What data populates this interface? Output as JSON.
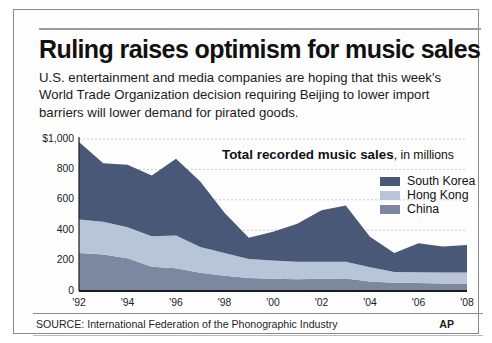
{
  "headline": "Ruling raises optimism for music sales",
  "deck": "U.S. entertainment and media companies are hoping that this week's World Trade Organization decision requiring Beijing to lower import barriers will lower demand for pirated goods.",
  "source": {
    "label": "SOURCE: International Federation of the Phonographic Industry",
    "credit": "AP"
  },
  "colors": {
    "south_korea": "#4a5878",
    "hong_kong": "#b8c4d8",
    "china": "#7c889f",
    "axis": "#1b1b1b",
    "grid": "#c9c9d2"
  },
  "chart_data": {
    "type": "area",
    "stacked": true,
    "title": "Total recorded music sales",
    "subtitle": ", in millions",
    "xlabel": "",
    "ylabel": "",
    "ylim": [
      0,
      1000
    ],
    "yticks": [
      0,
      200,
      400,
      600,
      800,
      1000
    ],
    "ytick_labels": [
      "0",
      "200",
      "400",
      "600",
      "800",
      "$1,000"
    ],
    "grid": true,
    "legend_position": "top-right",
    "x": [
      1992,
      1993,
      1994,
      1995,
      1996,
      1997,
      1998,
      1999,
      2000,
      2001,
      2002,
      2003,
      2004,
      2005,
      2006,
      2007,
      2008
    ],
    "xtick_values": [
      1992,
      1994,
      1996,
      1998,
      2000,
      2002,
      2004,
      2006,
      2008
    ],
    "xtick_labels": [
      "'92",
      "'94",
      "'96",
      "'98",
      "'00",
      "'02",
      "'04",
      "'06",
      "'08"
    ],
    "series": [
      {
        "name": "China",
        "color": "#7c889f",
        "values": [
          250,
          240,
          215,
          160,
          150,
          120,
          100,
          85,
          80,
          78,
          80,
          82,
          62,
          55,
          52,
          50,
          50
        ]
      },
      {
        "name": "Hong Kong",
        "color": "#b8c4d8",
        "values": [
          220,
          215,
          205,
          200,
          215,
          170,
          150,
          125,
          120,
          115,
          112,
          110,
          95,
          70,
          72,
          72,
          72
        ]
      },
      {
        "name": "South Korea",
        "color": "#4a5878",
        "values": [
          510,
          385,
          410,
          400,
          505,
          430,
          265,
          140,
          190,
          250,
          340,
          370,
          200,
          125,
          190,
          170,
          180
        ]
      }
    ],
    "totals": [
      980,
      840,
      830,
      760,
      870,
      720,
      515,
      350,
      390,
      443,
      532,
      562,
      357,
      250,
      314,
      292,
      302
    ]
  }
}
